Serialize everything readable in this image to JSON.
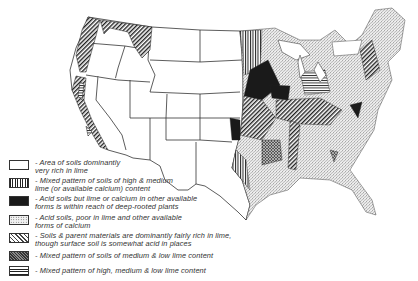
{
  "map": {
    "subject": "Lime content of soils, conterminous United States",
    "colors": {
      "ink": "#222222",
      "background": "#ffffff",
      "state_line": "#333333"
    }
  },
  "legend": {
    "items": [
      {
        "pattern": "blank",
        "text": "- Area of soils dominantly\nvery rich in lime"
      },
      {
        "pattern": "vertical-lines",
        "text": "- Mixed pattern of soils of high & medium\nlime (or available calcium) content"
      },
      {
        "pattern": "solid-black",
        "text": "- Acid soils but lime or calcium in other available\nforms is within reach of deep-rooted plants"
      },
      {
        "pattern": "fine-stipple",
        "text": "- Acid soils, poor in lime and other available\nforms of calcium"
      },
      {
        "pattern": "diagonal-lines",
        "text": "- Soils & parent materials are dominantly fairly rich in lime,\nthough surface soil is somewhat acid in places"
      },
      {
        "pattern": "crosshatch-dense",
        "text": "- Mixed pattern of soils of medium & low lime content"
      },
      {
        "pattern": "horizontal-lines",
        "text": "- Mixed pattern of high, medium & low lime content"
      }
    ]
  }
}
